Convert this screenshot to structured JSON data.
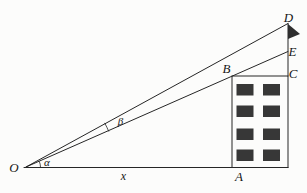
{
  "figure": {
    "background": "#fcfcfb",
    "line_color": "#262626",
    "window_color": "#373737",
    "flag_color": "#2e2e2e",
    "text_color": "#161616"
  },
  "labels": {
    "O": "O",
    "A": "A",
    "B": "B",
    "C": "C",
    "D": "D",
    "E": "E",
    "alpha": "α",
    "beta": "β",
    "x_distance": "x"
  },
  "windows": {
    "row_tops": [
      84,
      105.5,
      128.5,
      149.5
    ],
    "col_lefts": [
      236.5,
      263
    ],
    "width": 17,
    "height": 11.5
  }
}
